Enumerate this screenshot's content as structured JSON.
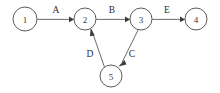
{
  "figure": {
    "kind": "directed-graph-diagram",
    "background_color": "#ffffff",
    "node_stroke_color": "#4a4a4a",
    "edge_color": "#5a5a5a",
    "text_color": "#2e2e2e",
    "width": 220,
    "height": 93
  },
  "nodes": [
    {
      "id": "1",
      "label": "1",
      "cx": 25,
      "cy": 19,
      "r": 12
    },
    {
      "id": "2",
      "label": "2",
      "cx": 85,
      "cy": 19,
      "r": 11
    },
    {
      "id": "3",
      "label": "3",
      "cx": 141,
      "cy": 19,
      "r": 11
    },
    {
      "id": "4",
      "label": "4",
      "cx": 196,
      "cy": 19,
      "r": 11
    },
    {
      "id": "5",
      "label": "5",
      "cx": 111,
      "cy": 76,
      "r": 11
    }
  ],
  "edges": [
    {
      "id": "A",
      "label": "A",
      "from": "1",
      "to": "2",
      "label_x": 56,
      "label_y": 10
    },
    {
      "id": "B",
      "label": "B",
      "from": "2",
      "to": "3",
      "label_x": 112,
      "label_y": 10
    },
    {
      "id": "E",
      "label": "E",
      "from": "3",
      "to": "4",
      "label_x": 167,
      "label_y": 10
    },
    {
      "id": "D",
      "label": "D",
      "from": "5",
      "to": "2",
      "label_x": 90,
      "label_y": 54
    },
    {
      "id": "C",
      "label": "C",
      "from": "3",
      "to": "5",
      "label_x": 132,
      "label_y": 54
    }
  ]
}
